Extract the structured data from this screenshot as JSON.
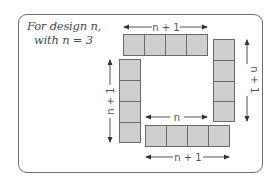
{
  "caption": {
    "line1": "For design n,",
    "line2": "with n = 3"
  },
  "n": 3,
  "labels": {
    "top_row": "n + 1",
    "right_column": "n + 1",
    "left_column": "n + 1",
    "bottom_inner": "n",
    "bottom_row": "n + 1"
  },
  "groups": {
    "top_row": {
      "tiles": 4,
      "orientation": "horizontal"
    },
    "right_column": {
      "tiles": 4,
      "orientation": "vertical"
    },
    "left_column": {
      "tiles": 4,
      "orientation": "vertical"
    },
    "bottom_row": {
      "tiles": 4,
      "orientation": "horizontal"
    }
  },
  "colors": {
    "tile_fill": "#cfcfcf",
    "tile_border": "#6a6a6a",
    "frame_border": "#6f6f6f",
    "text": "#4a4a4a"
  }
}
